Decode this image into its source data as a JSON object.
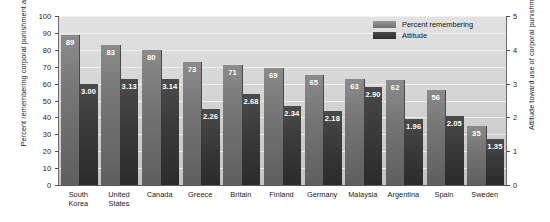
{
  "chart_data": {
    "type": "bar",
    "title": "",
    "subtitle": "",
    "xlabel": "",
    "ylabel": "Percent remembering corporal punishment as a child",
    "ylabel_right": "Attitude toward use of corporal punishment",
    "ylim": [
      0,
      100
    ],
    "ylim_right": [
      0,
      5
    ],
    "yticks": [
      "0",
      "10",
      "20",
      "30",
      "40",
      "50",
      "60",
      "70",
      "80",
      "90",
      "100"
    ],
    "yticks_right": [
      "0",
      "1",
      "2",
      "3",
      "4",
      "5"
    ],
    "grid": true,
    "legend_position": "top-right",
    "legend": [
      "Percent remembering",
      "Attitude"
    ],
    "categories": [
      "South Korea",
      "United States",
      "Canada",
      "Greece",
      "Britain",
      "Finland",
      "Germany",
      "Malaysia",
      "Argentina",
      "Spain",
      "Sweden"
    ],
    "series": [
      {
        "name": "Percent remembering",
        "axis": "left",
        "color": "#757575",
        "values": [
          89,
          83,
          80,
          73,
          71,
          69,
          65,
          63,
          62,
          56,
          35
        ],
        "labels": [
          "89",
          "83",
          "80",
          "73",
          "71",
          "69",
          "65",
          "63",
          "62",
          "56",
          "35"
        ]
      },
      {
        "name": "Attitude",
        "axis": "right",
        "color": "#333333",
        "values": [
          3.0,
          3.13,
          3.14,
          2.26,
          2.68,
          2.34,
          2.18,
          2.9,
          1.96,
          2.05,
          1.35
        ],
        "labels": [
          "3.00",
          "3.13",
          "3.14",
          "2.26",
          "2.68",
          "2.34",
          "2.18",
          "2.90",
          "1.96",
          "2.05",
          "1.35"
        ]
      }
    ]
  },
  "colors": {
    "plot_background": "#d6d6d6",
    "gridline": "#f2f2f2",
    "axis": "#5a5a5a",
    "text": "#1a1a1a",
    "bar_percent": "#757575",
    "bar_attitude": "#333333",
    "bar_label_text": "#ffffff"
  }
}
